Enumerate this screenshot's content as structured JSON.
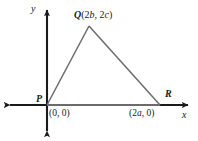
{
  "figure": {
    "type": "coordinate-geometry-diagram",
    "axes": {
      "x_label": "x",
      "y_label": "y",
      "x_axis_y_px": 105,
      "y_axis_x_px": 47,
      "axis_color": "#1a1a1a"
    },
    "triangle": {
      "name": "PQR",
      "stroke_color": "#6b6b6b",
      "vertices": [
        {
          "id": "P",
          "label": "P",
          "coord_label": "(0, 0)",
          "x_px": 47,
          "y_px": 105,
          "algebraic": {
            "x": "0",
            "y": "0"
          }
        },
        {
          "id": "Q",
          "label": "Q",
          "coord_label": "(2b, 2c)",
          "apex_full_label": "Q(2b, 2c)",
          "x_px": 89,
          "y_px": 26,
          "algebraic": {
            "x": "2b",
            "y": "2c"
          }
        },
        {
          "id": "R",
          "label": "R",
          "coord_label": "(2a, 0)",
          "x_px": 160,
          "y_px": 105,
          "algebraic": {
            "x": "2a",
            "y": "0"
          }
        }
      ]
    },
    "apex_parts": {
      "point": "Q",
      "open_paren": "(",
      "first_coeff": "2",
      "first_var": "b",
      "comma": ", ",
      "second_coeff": "2",
      "second_var": "c",
      "close_paren": ")"
    },
    "origin_parts": {
      "text": "(0, 0)"
    },
    "r_coord_parts": {
      "open": "(2",
      "var": "a",
      "close": ", 0)"
    }
  }
}
